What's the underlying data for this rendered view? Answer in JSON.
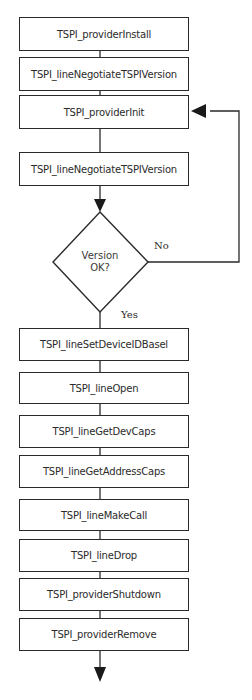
{
  "diagram": {
    "type": "flowchart",
    "steps": [
      {
        "label": "TSPI_providerInstall"
      },
      {
        "label": "TSPI_lineNegotiateTSPIVersion"
      },
      {
        "label": "TSPI_providerInit"
      },
      {
        "label": "TSPI_lineNegotiateTSPIVersion"
      },
      {
        "label": "TSPI_lineSetDeviceIDBasel"
      },
      {
        "label": "TSPI_lineOpen"
      },
      {
        "label": "TSPI_lineGetDevCaps"
      },
      {
        "label": "TSPI_lineGetAddressCaps"
      },
      {
        "label": "TSPI_lineMakeCall"
      },
      {
        "label": "TSPI_lineDrop"
      },
      {
        "label": "TSPI_providerShutdown"
      },
      {
        "label": "TSPI_providerRemove"
      }
    ],
    "decision": {
      "line1": "Version",
      "line2": "OK?",
      "no_label": "No",
      "yes_label": "Yes"
    },
    "colors": {
      "stroke": "#2a2a2a",
      "text": "#2b2b2b",
      "background": "#ffffff"
    }
  }
}
